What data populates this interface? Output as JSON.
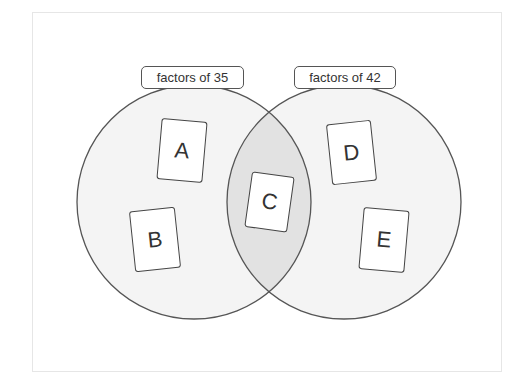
{
  "diagram": {
    "type": "venn",
    "sets": [
      {
        "id": "left",
        "label": "factors of 35"
      },
      {
        "id": "right",
        "label": "factors of 42"
      }
    ],
    "cards": [
      {
        "id": "A",
        "label": "A",
        "region": "left-only"
      },
      {
        "id": "B",
        "label": "B",
        "region": "left-only"
      },
      {
        "id": "C",
        "label": "C",
        "region": "intersection"
      },
      {
        "id": "D",
        "label": "D",
        "region": "right-only"
      },
      {
        "id": "E",
        "label": "E",
        "region": "right-only"
      }
    ],
    "colors": {
      "circle_fill": "#f4f4f4",
      "intersection_fill": "#e2e2e2",
      "stroke": "#555555"
    }
  }
}
